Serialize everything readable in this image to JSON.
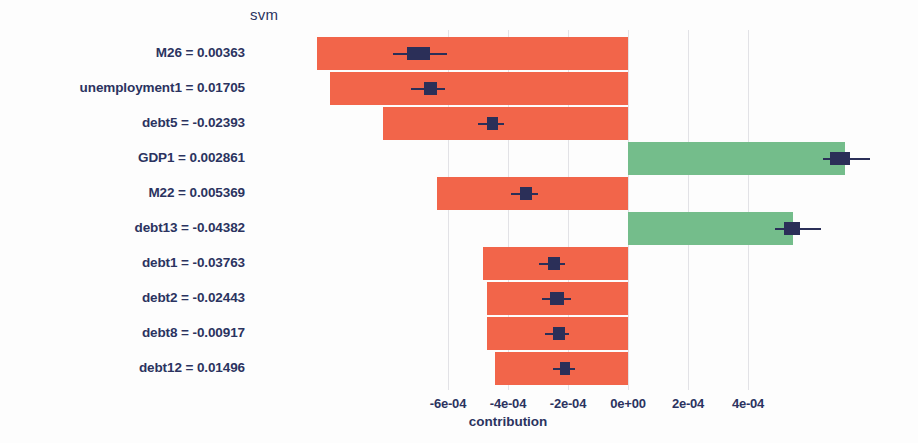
{
  "chart_data": {
    "type": "bar",
    "orientation": "horizontal",
    "title": "svm",
    "xlabel": "contribution",
    "ylabel": "",
    "grid": true,
    "legend": false,
    "xlim": [
      -0.00072,
      0.00048
    ],
    "xticks": [
      -0.0006,
      -0.0004,
      -0.0002,
      0,
      0.0002,
      0.0004
    ],
    "xticklabels": [
      "-6e-04",
      "-4e-04",
      "-2e-04",
      "0e+00",
      "2e-04",
      "4e-04"
    ],
    "categories": [
      "M26 = 0.00363",
      "unemployment1 = 0.01705",
      "debt5 = -0.02393",
      "GDP1 = 0.002861",
      "M22 = 0.005369",
      "debt13 = -0.04382",
      "debt1 = -0.03763",
      "debt2 = -0.02443",
      "debt8 = -0.00917",
      "debt12 = 0.01496"
    ],
    "values": [
      -0.001037,
      -0.000993,
      -0.000817,
      0.000723,
      -0.000637,
      0.00055,
      -0.000483,
      -0.00047,
      -0.00047,
      -0.000443
    ],
    "colors": {
      "negative": "#f2654a",
      "positive": "#74bd8b",
      "marker": "#2b2f58"
    },
    "markers": [
      {
        "center": -0.000653,
        "low": -0.000783,
        "high": -0.000603,
        "box_low": -0.000737,
        "box_high": -0.00066
      },
      {
        "center": -0.000653,
        "low": -0.000723,
        "high": -0.00061,
        "box_low": -0.00068,
        "box_high": -0.000637
      },
      {
        "center": -0.00045,
        "low": -0.0005,
        "high": -0.000413,
        "box_low": -0.00047,
        "box_high": -0.000433
      },
      {
        "center": 0.000707,
        "low": 0.00065,
        "high": 0.000807,
        "box_low": 0.000673,
        "box_high": 0.00074
      },
      {
        "center": -0.00034,
        "low": -0.00039,
        "high": -0.0003,
        "box_low": -0.00036,
        "box_high": -0.00032
      },
      {
        "center": 0.000547,
        "low": 0.00049,
        "high": 0.000643,
        "box_low": 0.00052,
        "box_high": 0.000573
      },
      {
        "center": -0.000247,
        "low": -0.000297,
        "high": -0.00021,
        "box_low": -0.000267,
        "box_high": -0.000227
      },
      {
        "center": -0.000237,
        "low": -0.000287,
        "high": -0.00019,
        "box_low": -0.00026,
        "box_high": -0.000213
      },
      {
        "center": -0.00023,
        "low": -0.000277,
        "high": -0.000197,
        "box_low": -0.00025,
        "box_high": -0.00021
      },
      {
        "center": -0.00021,
        "low": -0.00025,
        "high": -0.000177,
        "box_low": -0.000227,
        "box_high": -0.000193
      }
    ]
  }
}
